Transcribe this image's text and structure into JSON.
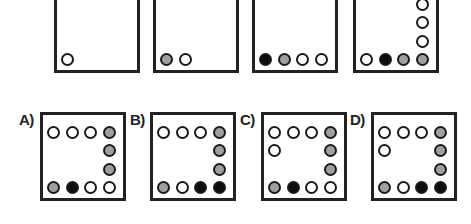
{
  "puzzle": {
    "sequence": [
      {
        "dots": [
          {
            "col": 0,
            "row": 3,
            "color": "white"
          }
        ]
      },
      {
        "dots": [
          {
            "col": 0,
            "row": 3,
            "color": "gray"
          },
          {
            "col": 1,
            "row": 3,
            "color": "white"
          }
        ]
      },
      {
        "dots": [
          {
            "col": 0,
            "row": 3,
            "color": "black"
          },
          {
            "col": 1,
            "row": 3,
            "color": "gray"
          },
          {
            "col": 2,
            "row": 3,
            "color": "white"
          },
          {
            "col": 3,
            "row": 3,
            "color": "white"
          }
        ]
      },
      {
        "dots": [
          {
            "col": 0,
            "row": 3,
            "color": "white"
          },
          {
            "col": 1,
            "row": 3,
            "color": "black"
          },
          {
            "col": 2,
            "row": 3,
            "color": "gray"
          },
          {
            "col": 3,
            "row": 3,
            "color": "gray"
          },
          {
            "col": 3,
            "row": 2,
            "color": "white"
          },
          {
            "col": 3,
            "row": 1,
            "color": "white"
          },
          {
            "col": 3,
            "row": 0,
            "color": "white"
          }
        ]
      }
    ],
    "options": [
      {
        "label": "A)",
        "dots": [
          {
            "col": 0,
            "row": 0,
            "color": "white"
          },
          {
            "col": 1,
            "row": 0,
            "color": "white"
          },
          {
            "col": 2,
            "row": 0,
            "color": "white"
          },
          {
            "col": 3,
            "row": 0,
            "color": "gray"
          },
          {
            "col": 3,
            "row": 1,
            "color": "gray"
          },
          {
            "col": 3,
            "row": 2,
            "color": "gray"
          },
          {
            "col": 0,
            "row": 3,
            "color": "gray"
          },
          {
            "col": 1,
            "row": 3,
            "color": "black"
          },
          {
            "col": 2,
            "row": 3,
            "color": "white"
          },
          {
            "col": 3,
            "row": 3,
            "color": "white"
          }
        ]
      },
      {
        "label": "B)",
        "dots": [
          {
            "col": 0,
            "row": 0,
            "color": "white"
          },
          {
            "col": 1,
            "row": 0,
            "color": "white"
          },
          {
            "col": 2,
            "row": 0,
            "color": "white"
          },
          {
            "col": 3,
            "row": 0,
            "color": "gray"
          },
          {
            "col": 3,
            "row": 1,
            "color": "gray"
          },
          {
            "col": 3,
            "row": 2,
            "color": "gray"
          },
          {
            "col": 0,
            "row": 3,
            "color": "gray"
          },
          {
            "col": 1,
            "row": 3,
            "color": "white"
          },
          {
            "col": 2,
            "row": 3,
            "color": "black"
          },
          {
            "col": 3,
            "row": 3,
            "color": "black"
          }
        ]
      },
      {
        "label": "C)",
        "dots": [
          {
            "col": 0,
            "row": 0,
            "color": "white"
          },
          {
            "col": 1,
            "row": 0,
            "color": "white"
          },
          {
            "col": 2,
            "row": 0,
            "color": "white"
          },
          {
            "col": 3,
            "row": 0,
            "color": "gray"
          },
          {
            "col": 0,
            "row": 1,
            "color": "white"
          },
          {
            "col": 3,
            "row": 1,
            "color": "gray"
          },
          {
            "col": 3,
            "row": 2,
            "color": "gray"
          },
          {
            "col": 0,
            "row": 3,
            "color": "gray"
          },
          {
            "col": 1,
            "row": 3,
            "color": "black"
          },
          {
            "col": 2,
            "row": 3,
            "color": "white"
          },
          {
            "col": 3,
            "row": 3,
            "color": "white"
          }
        ]
      },
      {
        "label": "D)",
        "dots": [
          {
            "col": 0,
            "row": 0,
            "color": "white"
          },
          {
            "col": 1,
            "row": 0,
            "color": "white"
          },
          {
            "col": 2,
            "row": 0,
            "color": "white"
          },
          {
            "col": 3,
            "row": 0,
            "color": "gray"
          },
          {
            "col": 0,
            "row": 1,
            "color": "white"
          },
          {
            "col": 3,
            "row": 1,
            "color": "gray"
          },
          {
            "col": 3,
            "row": 2,
            "color": "gray"
          },
          {
            "col": 0,
            "row": 3,
            "color": "gray"
          },
          {
            "col": 1,
            "row": 3,
            "color": "white"
          },
          {
            "col": 2,
            "row": 3,
            "color": "black"
          },
          {
            "col": 3,
            "row": 3,
            "color": "black"
          }
        ]
      }
    ],
    "colors": {
      "white": "#ffffff",
      "gray": "#a0a0a0",
      "black": "#0d0d0d",
      "border": "#222222"
    }
  }
}
